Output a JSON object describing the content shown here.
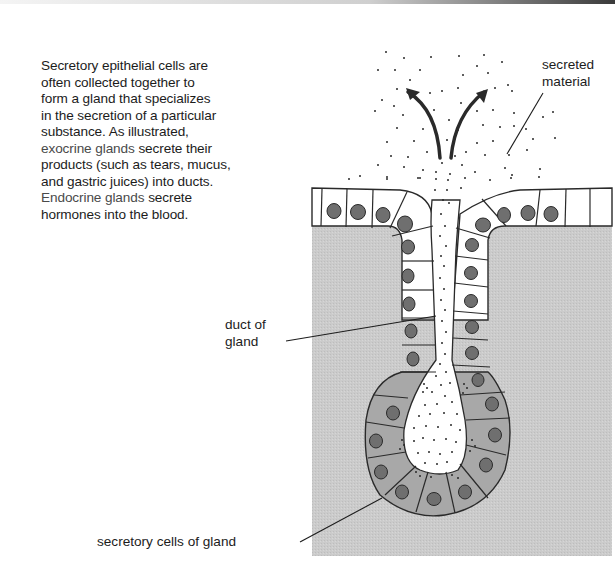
{
  "figure": {
    "caption": {
      "lines": [
        "Secretory epithelial cells are",
        "often collected together to",
        "form a gland that specializes",
        "in the secretion of a particular",
        "substance.  As illustrated,"
      ],
      "exocrine_term": "exocrine glands",
      "exocrine_rest_1": " secrete their",
      "exocrine_rest_2": "products (such as tears, mucus,",
      "exocrine_rest_3": "and gastric juices) into ducts.",
      "endocrine_term": "Endocrine glands",
      "endocrine_rest_1": " secrete",
      "endocrine_rest_2": "hormones into the blood."
    },
    "labels": {
      "secreted_material_1": "secreted",
      "secreted_material_2": "material",
      "duct_1": "duct of",
      "duct_2": "gland",
      "secretory_cells": "secretory cells of gland"
    },
    "colors": {
      "tissue_gray": "#c9c9c9",
      "secretory_cell_gray": "#a9a9a9",
      "nucleus_gray": "#6f6f6f",
      "outline": "#2a2a2a"
    }
  }
}
